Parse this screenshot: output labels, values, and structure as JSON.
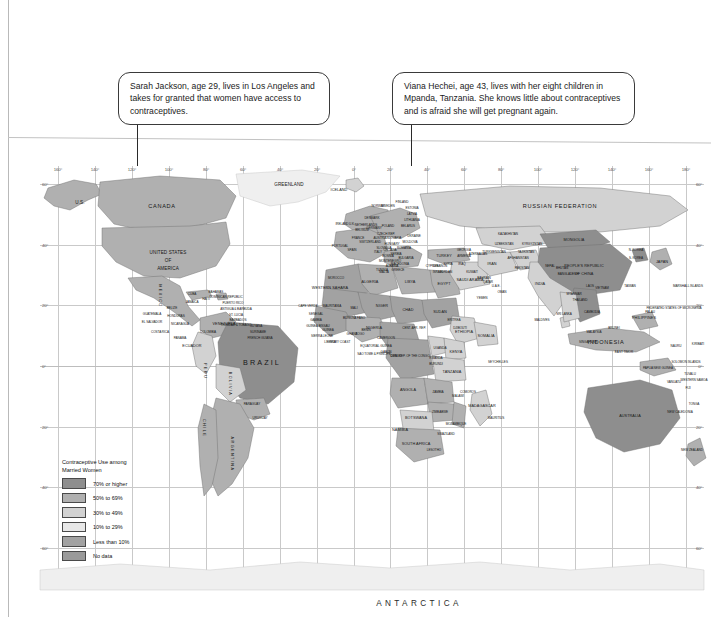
{
  "document": {
    "type": "printed-map-page",
    "map_title_implicit": "Contraceptive Use among Married Women",
    "antarctica_label": "ANTARCTICA"
  },
  "callouts": [
    {
      "id": "sarah",
      "name": "Sarah Jackson",
      "text": "Sarah Jackson, age 29, lives in Los Angeles and takes for granted that women have access to contraceptives.",
      "points_to": "Los Angeles, United States"
    },
    {
      "id": "viana",
      "name": "Viana Hechei",
      "text": "Viana Hechei, age 43, lives with her eight children in Mpanda, Tanzania. She knows little about contraceptives and is afraid she will get pregnant again.",
      "points_to": "Mpanda, Tanzania"
    }
  ],
  "legend": {
    "title_line1": "Contraceptive Use among",
    "title_line2": "Married Women",
    "items": [
      {
        "label": "70% or higher",
        "color": "#8e8e8e",
        "class": "c70"
      },
      {
        "label": "50% to 69%",
        "color": "#b0b0b0",
        "class": "c50"
      },
      {
        "label": "30% to 49%",
        "color": "#d2d2d2",
        "class": "c30"
      },
      {
        "label": "10% to 29%",
        "color": "#e8e8e8",
        "class": "c10"
      },
      {
        "label": "Less than 10%",
        "color": "#a2a2a2",
        "class": "c00"
      },
      {
        "label": "No data",
        "color": "#9a9a9a",
        "class": "cnd"
      }
    ]
  },
  "graticule": {
    "longitude_ticks": [
      "160°",
      "140°",
      "120°",
      "100°",
      "80°",
      "60°",
      "40°",
      "20°",
      "0°",
      "20°",
      "40°",
      "60°",
      "80°",
      "100°",
      "120°",
      "140°",
      "160°",
      "180°"
    ],
    "latitude_ticks_left": [
      "60°",
      "40°",
      "20°",
      "0°",
      "20°",
      "40°",
      "60°"
    ],
    "latitude_ticks_right": [
      "60°",
      "40°",
      "20°",
      "0°",
      "20°",
      "40°",
      "60°"
    ],
    "grid": true
  },
  "map_labels": {
    "north_america": [
      "U.S.",
      "CANADA",
      "UNITED STATES",
      "OF",
      "AMERICA",
      "GREENLAND",
      "ICELAND",
      "MEXICO",
      "CUBA",
      "BAHAMAS",
      "JAMAICA",
      "HAITI",
      "DOMINICAN REPUBLIC",
      "PUERTO RICO",
      "ANTIGUA & BARBUDA",
      "ST. LUCIA",
      "BARBADOS",
      "TRINIDAD & TOBAGO",
      "GUATEMALA",
      "BELIZE",
      "HONDURAS",
      "EL SALVADOR",
      "NICARAGUA",
      "COSTA RICA",
      "PANAMA"
    ],
    "south_america": [
      "COLOMBIA",
      "VENEZUELA",
      "GUYANA",
      "SURINAME",
      "FRENCH GUIANA",
      "ECUADOR",
      "PERU",
      "BRAZIL",
      "BOLIVIA",
      "PARAGUAY",
      "CHILE",
      "ARGENTINA",
      "URUGUAY"
    ],
    "europe": [
      "PORTUGAL",
      "SPAIN",
      "FRANCE",
      "IRELAND",
      "U.K.",
      "BELGIUM",
      "NETHERLANDS",
      "LUXEMBOURG",
      "GERMANY",
      "DENMARK",
      "NORWAY",
      "SWEDEN",
      "FINLAND",
      "ESTONIA",
      "LATVIA",
      "LITHUANIA",
      "POLAND",
      "BELARUS",
      "UKRAINE",
      "MOLDOVA",
      "CZECH REP.",
      "SLOVAKIA",
      "AUSTRIA",
      "HUNGARY",
      "SWITZERLAND",
      "ITALY",
      "SLOVENIA",
      "CROATIA",
      "BOSNIA",
      "SERBIA",
      "MONTENEGRO",
      "ALBANIA",
      "MACEDONIA",
      "BULGARIA",
      "ROMANIA",
      "GREECE",
      "MALTA",
      "CYPRUS"
    ],
    "africa": [
      "MOROCCO",
      "WESTERN SAHARA",
      "ALGERIA",
      "TUNISIA",
      "LIBYA",
      "EGYPT",
      "MAURITANIA",
      "MALI",
      "NIGER",
      "CHAD",
      "SUDAN",
      "ERITREA",
      "DJIBOUTI",
      "ETHIOPIA",
      "SOMALIA",
      "SENEGAL",
      "GAMBIA",
      "GUINEA-BISSAU",
      "GUINEA",
      "SIERRA LEONE",
      "LIBERIA",
      "IVORY COAST",
      "BURKINA FASO",
      "GHANA",
      "TOGO",
      "BENIN",
      "NIGERIA",
      "CAMEROON",
      "CENT. AFR. REP.",
      "EQUATORIAL GUINEA",
      "SAO TOME & PRINCIPE",
      "GABON",
      "CONGO",
      "DEM. REP. OF THE CONGO",
      "UGANDA",
      "KENYA",
      "RWANDA",
      "BURUNDI",
      "TANZANIA",
      "ANGOLA",
      "ZAMBIA",
      "MALAWI",
      "MOZAMBIQUE",
      "ZIMBABWE",
      "BOTSWANA",
      "NAMIBIA",
      "SOUTH AFRICA",
      "SWAZILAND",
      "LESOTHO",
      "MADAGASCAR",
      "MAURITIUS",
      "COMOROS",
      "SEYCHELLES",
      "CAPE VERDE"
    ],
    "middle_east_asia": [
      "TURKEY",
      "SYRIA",
      "LEBANON",
      "ISRAEL",
      "JORDAN",
      "IRAQ",
      "IRAN",
      "KUWAIT",
      "SAUDI ARABIA",
      "BAHRAIN",
      "QATAR",
      "U.A.E.",
      "OMAN",
      "YEMEN",
      "GEORGIA",
      "ARMENIA",
      "AZERBAIJAN",
      "RUSSIAN FEDERATION",
      "KAZAKHSTAN",
      "UZBEKISTAN",
      "TURKMENISTAN",
      "KYRGYZSTAN",
      "TAJIKISTAN",
      "AFGHANISTAN",
      "PAKISTAN",
      "INDIA",
      "NEPAL",
      "BHUTAN",
      "BANGLADESH",
      "SRI LANKA",
      "MALDIVES",
      "MONGOLIA",
      "PEOPLE'S REPUBLIC",
      "OF CHINA",
      "N. KOREA",
      "S. KOREA",
      "JAPAN",
      "TAIWAN",
      "MYANMAR",
      "THAILAND",
      "LAOS",
      "VIETNAM",
      "CAMBODIA",
      "MALAYSIA",
      "SINGAPORE",
      "BRUNEI",
      "INDONESIA",
      "PHILIPPINES",
      "EAST TIMOR"
    ],
    "oceania": [
      "AUSTRALIA",
      "PAPUA NEW GUINEA",
      "NEW ZEALAND",
      "FIJI",
      "VANUATU",
      "NEW CALEDONIA",
      "SOLOMON ISLANDS",
      "NAURU",
      "KIRIBATI",
      "TUVALU",
      "WESTERN SAMOA",
      "TONGA",
      "MARSHALL ISLANDS",
      "FEDERATED STATES OF MICRONESIA",
      "PALAU"
    ]
  }
}
